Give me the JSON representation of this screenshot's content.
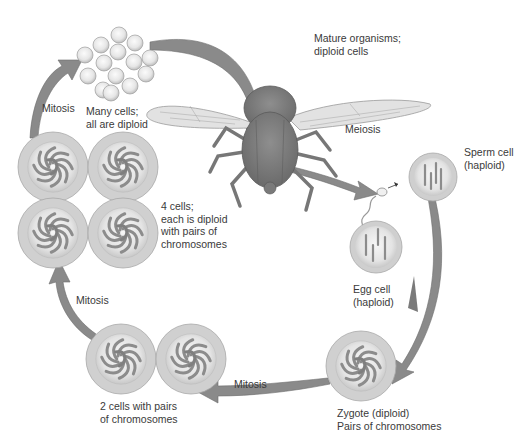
{
  "colors": {
    "arrow": "#8a8a8a",
    "arrow_dark": "#6f6f6f",
    "cell_outer": "#d2d2d2",
    "cell_inner": "#ececec",
    "chromosome": "#8c8c8c",
    "fly_body": "#7d7d7d",
    "wing": "#e2e2e2",
    "text": "#3a3a3a"
  },
  "stages": {
    "mature": {
      "lines": [
        "Mature organisms;",
        "diploid cells"
      ]
    },
    "meiosis": {
      "label": "Meiosis"
    },
    "sperm": {
      "lines": [
        "Sperm cell",
        "(haploid)"
      ]
    },
    "egg": {
      "lines": [
        "Egg cell",
        "(haploid)"
      ]
    },
    "zygote": {
      "lines": [
        "Zygote (diploid)",
        "Pairs of chromosomes"
      ]
    },
    "mitosis_1": {
      "label": "Mitosis"
    },
    "two_cells": {
      "lines": [
        "2 cells with pairs",
        "of chromosomes"
      ]
    },
    "mitosis_2": {
      "label": "Mitosis"
    },
    "four_cells": {
      "lines": [
        "4 cells;",
        "each is diploid",
        "with pairs of",
        "chromosomes"
      ]
    },
    "mitosis_3": {
      "label": "Mitosis"
    },
    "many_cells": {
      "lines": [
        "Many cells;",
        "all are diploid"
      ]
    }
  }
}
